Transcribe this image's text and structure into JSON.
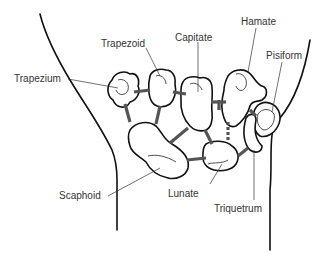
{
  "diagram": {
    "type": "anatomical-line-drawing",
    "labels": [
      {
        "id": "trapezium",
        "text": "Trapezium",
        "x": 14,
        "y": 74
      },
      {
        "id": "trapezoid",
        "text": "Trapezoid",
        "x": 101,
        "y": 39
      },
      {
        "id": "capitate",
        "text": "Capitate",
        "x": 175,
        "y": 33
      },
      {
        "id": "hamate",
        "text": "Hamate",
        "x": 241,
        "y": 17
      },
      {
        "id": "pisiform",
        "text": "Pisiform",
        "x": 266,
        "y": 51
      },
      {
        "id": "scaphoid",
        "text": "Scaphoid",
        "x": 59,
        "y": 191
      },
      {
        "id": "lunate",
        "text": "Lunate",
        "x": 168,
        "y": 189
      },
      {
        "id": "triquetrum",
        "text": "Triquetrum",
        "x": 214,
        "y": 204
      }
    ],
    "colors": {
      "outline": "#111111",
      "ligament": "#555555",
      "label_text": "#333333",
      "background": "#ffffff"
    }
  }
}
